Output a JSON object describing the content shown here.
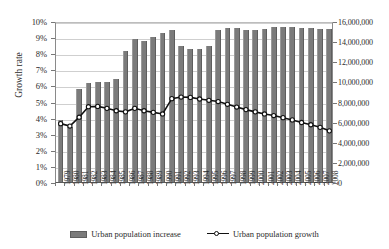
{
  "chart_data": {
    "type": "bar",
    "title": "",
    "subtitle": "",
    "xlabel": "",
    "ylabel": "Growth rate",
    "ylabel_right": "",
    "grid": true,
    "legend_position": "bottom",
    "categories": [
      "1979",
      "1980",
      "1981",
      "1982",
      "1983",
      "1984",
      "1985",
      "1986",
      "1987",
      "1988",
      "1989",
      "1990",
      "1991",
      "1992",
      "1993",
      "1994",
      "1995",
      "1996",
      "1997",
      "1998",
      "1999",
      "2000",
      "2001",
      "2002",
      "2003",
      "2004",
      "2005",
      "2006",
      "2007",
      "2008"
    ],
    "y_left": {
      "label": "Growth rate",
      "min": 0,
      "max": 0.1,
      "tick_step": 0.01,
      "tick_labels": [
        "0%",
        "1%",
        "2%",
        "3%",
        "4%",
        "5%",
        "6%",
        "7%",
        "8%",
        "9%",
        "10%"
      ]
    },
    "y_right": {
      "label": "",
      "min": 0,
      "max": 16000000,
      "tick_step": 2000000,
      "tick_labels": [
        "0",
        "2,000,000",
        "4,000,000",
        "6,000,000",
        "8,000,000",
        "10,000,000",
        "12,000,000",
        "14,000,000",
        "16,000,000"
      ]
    },
    "series": [
      {
        "name": "Urban population increase",
        "type": "bar",
        "axis": "right",
        "color": "#7b7b7b",
        "values": [
          6200000,
          5500000,
          9200000,
          9800000,
          9900000,
          9900000,
          10200000,
          13000000,
          14200000,
          14000000,
          14400000,
          14800000,
          15100000,
          13500000,
          13200000,
          13200000,
          13500000,
          15100000,
          15300000,
          15300000,
          15100000,
          15100000,
          15200000,
          15400000,
          15400000,
          15400000,
          15300000,
          15300000,
          15200000,
          15200000
        ]
      },
      {
        "name": "Urban population growth",
        "type": "line",
        "axis": "left",
        "color": "#111111",
        "marker": "circle-open",
        "values": [
          0.0375,
          0.036,
          0.0415,
          0.048,
          0.0482,
          0.047,
          0.0455,
          0.0448,
          0.047,
          0.0455,
          0.0445,
          0.0435,
          0.053,
          0.054,
          0.0538,
          0.0528,
          0.052,
          0.0512,
          0.0495,
          0.0478,
          0.0462,
          0.0448,
          0.0435,
          0.0425,
          0.0412,
          0.0398,
          0.0382,
          0.0368,
          0.0352,
          0.033
        ]
      }
    ],
    "legend": [
      {
        "label": "Urban population increase",
        "marker": "bar-swatch",
        "color": "#7b7b7b"
      },
      {
        "label": "Urban population growth",
        "marker": "line-circle",
        "color": "#111111"
      }
    ]
  }
}
